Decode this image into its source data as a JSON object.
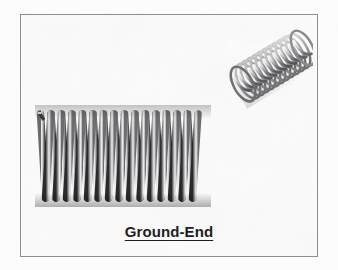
{
  "figure": {
    "caption": "Ground-End",
    "frame": {
      "border_color": "#8d8d92",
      "background_color": "#fcfcfc"
    },
    "page_background_color": "#fdfdfd",
    "caption_color": "#1e1e20"
  },
  "spring_2d": {
    "name": "ground-end-compression-spring-side-view",
    "coil_count": 13,
    "orientation": "horizontal-side-view",
    "end_type": "ground-end",
    "highlight_color": "#f2f2f2",
    "midtone_color": "#9a9a9c",
    "shadow_color": "#2a2a2c"
  },
  "spring_3d": {
    "name": "ground-end-compression-spring-isometric",
    "coil_count": 14,
    "orientation": "isometric-3d",
    "end_type": "ground-end",
    "highlight_color": "#efefef",
    "midtone_color": "#a8a8aa",
    "shadow_color": "#4a4a4d"
  }
}
